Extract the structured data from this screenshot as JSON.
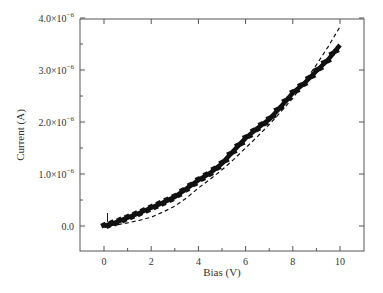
{
  "chart_data": {
    "type": "line",
    "title": "",
    "xlabel": "Bias (V)",
    "ylabel": "Current (A)",
    "xlim": [
      -1,
      11
    ],
    "ylim": [
      -4.8e-07,
      4e-06
    ],
    "grid": false,
    "legend": null,
    "x_ticks": [
      0,
      2,
      4,
      6,
      8,
      10
    ],
    "x_tick_labels": [
      "0",
      "2",
      "4",
      "6",
      "8",
      "10"
    ],
    "y_ticks": [
      0,
      1e-06,
      2e-06,
      3e-06,
      4e-06
    ],
    "y_tick_labels": [
      {
        "mant": "0.0",
        "exp": ""
      },
      {
        "mant": "1.0×10",
        "exp": "−6"
      },
      {
        "mant": "2.0×10",
        "exp": "−6"
      },
      {
        "mant": "3.0×10",
        "exp": "−6"
      },
      {
        "mant": "4.0×10",
        "exp": "−6"
      }
    ],
    "series": [
      {
        "name": "Measured",
        "style": "thick-markers",
        "color": "#111111",
        "x": [
          0,
          0.5,
          1,
          1.5,
          2,
          2.5,
          3,
          3.5,
          4,
          4.5,
          5,
          5.5,
          6,
          6.5,
          7,
          7.5,
          8,
          8.5,
          9,
          9.5,
          10
        ],
        "y": [
          0.0,
          7e-08,
          1.6e-07,
          2.5e-07,
          3.5e-07,
          4.5e-07,
          5.6e-07,
          7.2e-07,
          8.8e-07,
          1.02e-06,
          1.2e-06,
          1.45e-06,
          1.69e-06,
          1.88e-06,
          2.05e-06,
          2.3e-06,
          2.56e-06,
          2.75e-06,
          2.98e-06,
          3.2e-06,
          3.48e-06
        ]
      },
      {
        "name": "Fit",
        "style": "dashed",
        "color": "#111111",
        "x": [
          0,
          0.5,
          1,
          1.5,
          2,
          2.5,
          3,
          3.5,
          4,
          4.5,
          5,
          5.5,
          6,
          6.5,
          7,
          7.5,
          8,
          8.5,
          9,
          9.5,
          10
        ],
        "y": [
          0.0,
          2e-08,
          6e-08,
          1.1e-07,
          1.7e-07,
          2.7e-07,
          3.8e-07,
          5.4e-07,
          7.3e-07,
          9e-07,
          1.08e-06,
          1.28e-06,
          1.5e-06,
          1.72e-06,
          1.95e-06,
          2.2e-06,
          2.46e-06,
          2.77e-06,
          3.1e-06,
          3.45e-06,
          3.83e-06
        ]
      }
    ],
    "annotations": [
      {
        "type": "short-vertical-mark",
        "x": 0.15,
        "y_from": 8e-08,
        "y_to": 2.5e-07
      }
    ]
  }
}
